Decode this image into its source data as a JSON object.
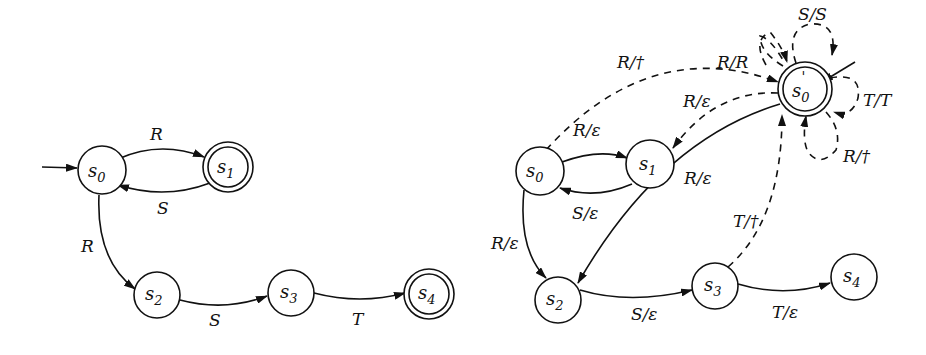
{
  "diagrams": [
    {
      "name": "original-automaton",
      "states": [
        {
          "id": "s0",
          "label": "s",
          "sub": "0",
          "initial": true,
          "accepting": false
        },
        {
          "id": "s1",
          "label": "s",
          "sub": "1",
          "initial": false,
          "accepting": true
        },
        {
          "id": "s2",
          "label": "s",
          "sub": "2",
          "initial": false,
          "accepting": false
        },
        {
          "id": "s3",
          "label": "s",
          "sub": "3",
          "initial": false,
          "accepting": false
        },
        {
          "id": "s4",
          "label": "s",
          "sub": "4",
          "initial": false,
          "accepting": true
        }
      ],
      "transitions": [
        {
          "from": "s0",
          "to": "s1",
          "label": "R",
          "style": "solid"
        },
        {
          "from": "s1",
          "to": "s0",
          "label": "S",
          "style": "solid"
        },
        {
          "from": "s0",
          "to": "s2",
          "label": "R",
          "style": "solid"
        },
        {
          "from": "s2",
          "to": "s3",
          "label": "S",
          "style": "solid"
        },
        {
          "from": "s3",
          "to": "s4",
          "label": "T",
          "style": "solid"
        }
      ]
    },
    {
      "name": "transducer",
      "states": [
        {
          "id": "s0",
          "label": "s",
          "sub": "0",
          "initial": false,
          "accepting": false
        },
        {
          "id": "s1",
          "label": "s",
          "sub": "1",
          "initial": false,
          "accepting": false
        },
        {
          "id": "s0p",
          "label": "s",
          "sub": "0",
          "prime": "'",
          "initial": true,
          "accepting": true
        },
        {
          "id": "s2",
          "label": "s",
          "sub": "2",
          "initial": false,
          "accepting": false
        },
        {
          "id": "s3",
          "label": "s",
          "sub": "3",
          "initial": false,
          "accepting": false
        },
        {
          "id": "s4",
          "label": "s",
          "sub": "4",
          "initial": false,
          "accepting": false
        }
      ],
      "transitions": [
        {
          "from": "s0",
          "to": "s1",
          "label": "R/ε",
          "style": "solid"
        },
        {
          "from": "s1",
          "to": "s0",
          "label": "S/ε",
          "style": "solid"
        },
        {
          "from": "s0",
          "to": "s2",
          "label": "R/ε",
          "style": "solid"
        },
        {
          "from": "s2",
          "to": "s3",
          "label": "S/ε",
          "style": "solid"
        },
        {
          "from": "s3",
          "to": "s4",
          "label": "T/ε",
          "style": "solid"
        },
        {
          "from": "s0",
          "to": "s0p",
          "label": "R/†",
          "style": "dashed"
        },
        {
          "from": "s0p",
          "to": "s1",
          "label": "R/ε",
          "style": "dashed"
        },
        {
          "from": "s0p",
          "to": "s2",
          "label": "R/ε",
          "style": "dashed"
        },
        {
          "from": "s3",
          "to": "s0p",
          "label": "T/†",
          "style": "dashed"
        },
        {
          "from": "s0p",
          "to": "s0p",
          "label": "R/R",
          "style": "dashed"
        },
        {
          "from": "s0p",
          "to": "s0p",
          "label": "S/S",
          "style": "dashed"
        },
        {
          "from": "s0p",
          "to": "s0p",
          "label": "T/T",
          "style": "dashed"
        },
        {
          "from": "s0p",
          "to": "s0p",
          "label": "R/†",
          "style": "dashed"
        }
      ]
    }
  ]
}
